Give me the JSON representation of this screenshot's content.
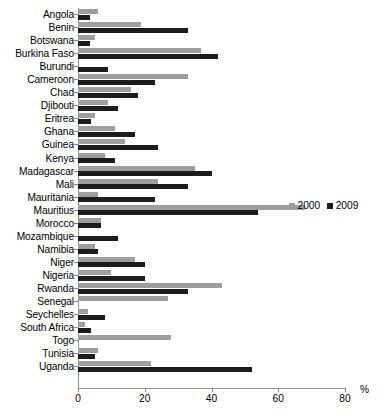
{
  "chart_data": {
    "type": "bar",
    "orientation": "horizontal",
    "title": "",
    "xlabel": "%",
    "ylabel": "",
    "xlim": [
      0,
      80
    ],
    "xticks": [
      0,
      20,
      40,
      60,
      80
    ],
    "xtick_labels": [
      "0",
      "20",
      "40",
      "60",
      "80"
    ],
    "grid": false,
    "legend_position": "right-middle",
    "colors": {
      "2000": "#9e9e9e",
      "2009": "#1c1c1c"
    },
    "categories": [
      "Angola",
      "Benin",
      "Botswana",
      "Burkina Faso",
      "Burundi",
      "Cameroon",
      "Chad",
      "Djibouti",
      "Eritrea",
      "Ghana",
      "Guinea",
      "Kenya",
      "Madagascar",
      "Mali",
      "Mauritania",
      "Mauritius",
      "Morocco",
      "Mozambique",
      "Namibia",
      "Niger",
      "Nigeria",
      "Rwanda",
      "Senegal",
      "Seychelles",
      "South Africa",
      "Togo",
      "Tunisia",
      "Uganda"
    ],
    "series": [
      {
        "name": "2000",
        "values": [
          6,
          19,
          5,
          37,
          0,
          33,
          16,
          9,
          5,
          11,
          14,
          8,
          35,
          24,
          6,
          68,
          7,
          0,
          5,
          17,
          10,
          43,
          27,
          3,
          2,
          28,
          6,
          22
        ]
      },
      {
        "name": "2009",
        "values": [
          3.5,
          33,
          3.5,
          42,
          9,
          23,
          18,
          12,
          4,
          17,
          24,
          11,
          40,
          33,
          23,
          54,
          7,
          12,
          6,
          20,
          20,
          33,
          0,
          8,
          4,
          0,
          5,
          52
        ]
      }
    ]
  },
  "legend": {
    "items": [
      {
        "label": "2000"
      },
      {
        "label": "2009"
      }
    ]
  },
  "axis": {
    "unit_label": "%"
  }
}
